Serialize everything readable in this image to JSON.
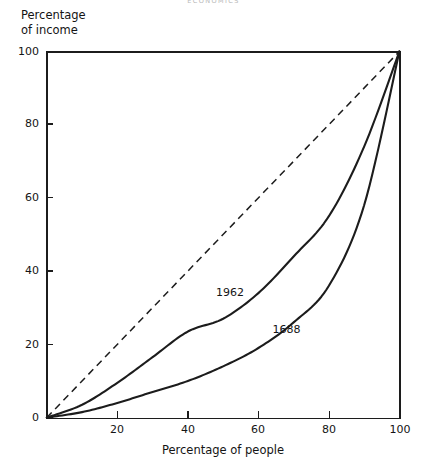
{
  "page_header": "ECONOMICS",
  "axes": {
    "y_title": "Percentage\nof income",
    "x_title": "Percentage of people",
    "y_ticks": [
      "0",
      "20",
      "40",
      "60",
      "80",
      "100"
    ],
    "x_ticks": [
      "20",
      "40",
      "60",
      "80",
      "100"
    ]
  },
  "annotations": {
    "label_1962": "1962",
    "label_1688": "1688"
  },
  "colors": {
    "line": "#1c1c1c",
    "axis": "#1c1c1c",
    "text": "#141414",
    "background": "#ffffff"
  },
  "chart_data": {
    "type": "line",
    "title": "",
    "xlabel": "Percentage of people",
    "ylabel": "Percentage of income",
    "xlim": [
      0,
      100
    ],
    "ylim": [
      0,
      100
    ],
    "xticks": [
      0,
      20,
      40,
      60,
      80,
      100
    ],
    "yticks": [
      0,
      20,
      40,
      60,
      80,
      100
    ],
    "grid": false,
    "legend": "inline-curve-labels",
    "x": [
      0,
      10,
      20,
      30,
      40,
      50,
      60,
      70,
      80,
      90,
      100
    ],
    "series": [
      {
        "name": "Line of equality",
        "style": "dashed",
        "label": "",
        "values": [
          0,
          10,
          20,
          30,
          40,
          50,
          60,
          70,
          80,
          90,
          100
        ]
      },
      {
        "name": "1962",
        "style": "solid",
        "label": "1962",
        "label_x": 48,
        "label_y": 34,
        "values": [
          0,
          3.5,
          9.5,
          16.5,
          23.5,
          27,
          34,
          44,
          55,
          74,
          100
        ]
      },
      {
        "name": "1688",
        "style": "solid",
        "label": "1688",
        "label_x": 64,
        "label_y": 24,
        "values": [
          0,
          1.5,
          4,
          7,
          10,
          14,
          19,
          26,
          36,
          58,
          100
        ]
      }
    ]
  }
}
